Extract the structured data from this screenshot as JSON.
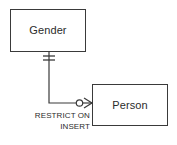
{
  "diagram": {
    "type": "entity-relationship-diagram",
    "notation": "crows-foot",
    "background_color": "#ffffff",
    "line_color": "#3a3a3a",
    "text_color": "#2b2b2b",
    "entities": [
      {
        "id": "gender",
        "label": "Gender",
        "x": 10,
        "y": 9,
        "width": 76,
        "height": 43
      },
      {
        "id": "person",
        "label": "Person",
        "x": 92,
        "y": 84,
        "width": 76,
        "height": 42
      }
    ],
    "relationship": {
      "from": "Gender",
      "to": "Person",
      "from_cardinality": "one-and-only-one",
      "to_cardinality": "zero-or-many",
      "from_symbol_name": "double-bar-icon",
      "to_symbol_name": "crows-foot-with-circle-icon",
      "constraint_line_1": "RESTRICT ON",
      "constraint_line_2": "INSERT"
    }
  }
}
